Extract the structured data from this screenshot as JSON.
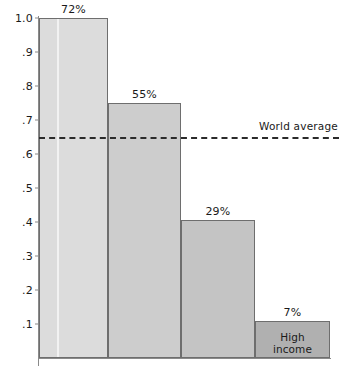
{
  "chart_data": {
    "type": "bar",
    "title": "",
    "subtitle": "",
    "xlabel": "",
    "ylabel": "",
    "ylim": [
      0,
      1.0
    ],
    "grid": false,
    "legend_position": "none",
    "categories": [
      "",
      "",
      "",
      "High\nincome"
    ],
    "values": [
      1.0,
      0.75,
      0.405,
      0.11
    ],
    "data_labels": [
      "72%",
      "55%",
      "29%",
      "7%"
    ],
    "bar_colors": [
      "#dcdcdc",
      "#cdcdcd",
      "#c4c4c4",
      "#b0b0b0"
    ],
    "bar_border_color": "#6e6e6e",
    "axis_color": "#8a8a8a",
    "ytick_labels": [
      "1.0",
      ".9",
      ".8",
      ".7",
      ".6",
      ".5",
      ".4",
      ".3",
      ".2",
      ".1"
    ],
    "ytick_values": [
      1.0,
      0.9,
      0.8,
      0.7,
      0.6,
      0.5,
      0.4,
      0.3,
      0.2,
      0.1
    ],
    "annotations": [
      {
        "name": "world-average",
        "label": "World average",
        "value": 0.65,
        "style": "dashed",
        "color": "#2b2b2b"
      }
    ],
    "bars": [
      {
        "name": "bar-1",
        "value": 1.0,
        "data_label": "72%",
        "inner_label": "",
        "color": "#dcdcdc",
        "left_pct": 0.0,
        "width_pct": 23.7,
        "has_stripe": true,
        "stripe_offset_pct": 26.0
      },
      {
        "name": "bar-2",
        "value": 0.75,
        "data_label": "55%",
        "inner_label": "",
        "color": "#cdcdcd",
        "left_pct": 23.7,
        "width_pct": 25.1,
        "has_stripe": false,
        "stripe_offset_pct": 0
      },
      {
        "name": "bar-3",
        "value": 0.405,
        "data_label": "29%",
        "inner_label": "",
        "color": "#c4c4c4",
        "left_pct": 48.8,
        "width_pct": 25.4,
        "has_stripe": false,
        "stripe_offset_pct": 0
      },
      {
        "name": "bar-4",
        "value": 0.11,
        "data_label": "7%",
        "inner_label_line1": "High",
        "inner_label_line2": "income",
        "color": "#b0b0b0",
        "left_pct": 74.2,
        "width_pct": 25.8,
        "has_stripe": false,
        "stripe_offset_pct": 0
      }
    ]
  }
}
